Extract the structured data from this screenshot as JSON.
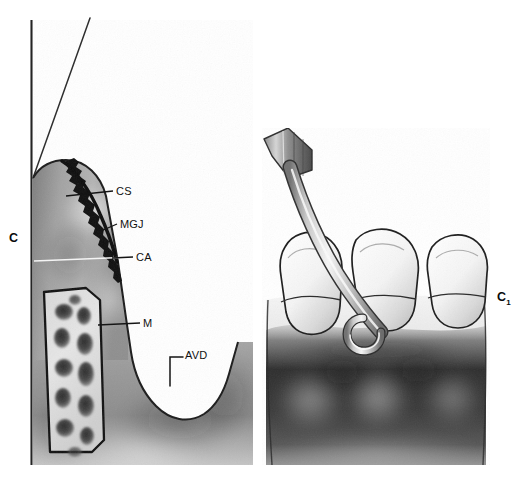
{
  "figure": {
    "background_color": "#ffffff",
    "width": 522,
    "height": 482,
    "ink_color": "#111111",
    "panels": [
      {
        "id": "panel-c",
        "label": "C",
        "label_position": "left-outside",
        "description": "Sagittal sectional drawing of gingiva, mucogingival complex, alveolar bone with trabecular marrow spaces and a vertical osseous defect",
        "bounds": {
          "x": 31,
          "y": 20,
          "width": 222,
          "height": 445
        },
        "tone": "grayscale stipple/wash"
      },
      {
        "id": "panel-c1",
        "label": "C₁",
        "label_position": "right-outside",
        "description": "Facial view of three teeth with a periodontal probe angled into the interproximal embrasure, darkly shaded attached gingiva and alveolar mucosa below",
        "bounds": {
          "x": 262,
          "y": 128,
          "width": 228,
          "height": 337
        },
        "tone": "grayscale wash"
      }
    ],
    "annotations": [
      {
        "key": "CS",
        "text": "CS",
        "expansion_not_shown": true,
        "leader": "horizontal line from gingival margin to label",
        "points_to": "scalloped dark gingival crest / col area",
        "x": 116,
        "y": 186
      },
      {
        "key": "MGJ",
        "text": "MGJ",
        "leader": "short angled tick from tissue edge to label",
        "points_to": "mucogingival junction on the facial contour",
        "x": 120,
        "y": 219
      },
      {
        "key": "CA",
        "text": "CA",
        "leader": "long light horizontal line across the section",
        "points_to": "crest of alveolar bone level",
        "x": 136,
        "y": 252
      },
      {
        "key": "M",
        "text": "M",
        "leader": "horizontal line from mucosa body to label",
        "points_to": "alveolar mucosa",
        "x": 143,
        "y": 318
      },
      {
        "key": "AVD",
        "text": "AVD",
        "leader": "L-shaped bracket opening toward the concavity",
        "points_to": "angular vertical defect in the bone crest",
        "x": 185,
        "y": 350
      },
      {
        "key": "C",
        "text": "C",
        "style": "bold panel letter",
        "points_to": "panel-c",
        "x": 9,
        "y": 232
      },
      {
        "key": "C1",
        "text": "C",
        "subscript": "1",
        "style": "bold panel letter with subscript",
        "points_to": "panel-c1",
        "x": 497,
        "y": 291
      }
    ],
    "reference_lines": [
      {
        "name": "vertical-reference-line",
        "description": "thin vertical rule at left edge of panel C running full height",
        "x1": 31,
        "y1": 20,
        "x2": 31,
        "y2": 465
      },
      {
        "name": "diagonal-reference-line",
        "description": "thin diagonal rule converging onto the vertical line near the gingival apex",
        "x1": 90,
        "y1": 18,
        "x2": 33,
        "y2": 178
      }
    ],
    "instrument": {
      "name": "periodontal-probe",
      "description": "straight handle with angled shank and curved working tip placed in the interdental embrasure",
      "color": "#f2f2f2",
      "outline_color": "#3a3a3a"
    },
    "teeth": [
      {
        "name": "tooth-left",
        "position": "mesial"
      },
      {
        "name": "tooth-center",
        "position": "middle"
      },
      {
        "name": "tooth-right",
        "position": "distal"
      }
    ]
  }
}
